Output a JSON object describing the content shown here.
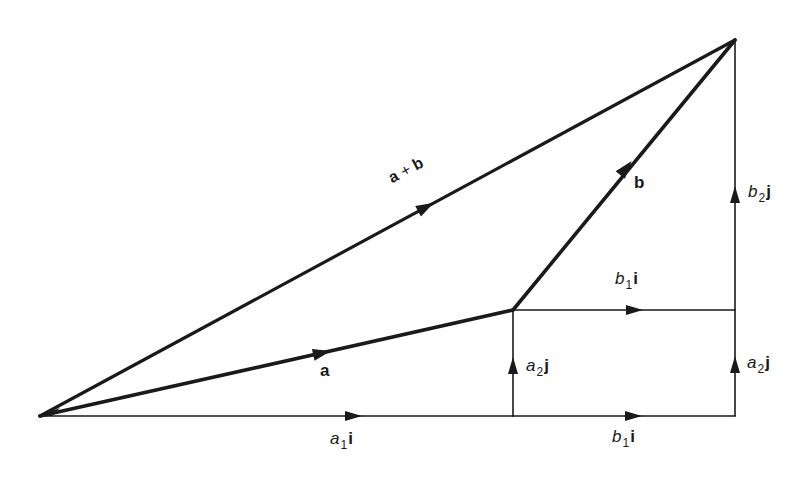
{
  "diagram": {
    "colors": {
      "stroke": "#1a1a1a",
      "background": "#ffffff"
    },
    "points": {
      "O": [
        40,
        416
      ],
      "A": [
        513,
        310
      ],
      "B": [
        735,
        40
      ],
      "C": [
        513,
        416
      ],
      "D": [
        735,
        416
      ],
      "E": [
        735,
        310
      ]
    },
    "labels": {
      "a_plus_b": {
        "a": "a",
        "plus": "+",
        "b": "b"
      },
      "a": "a",
      "b": "b",
      "a1i": {
        "base": "a",
        "sub": "1",
        "unit": "i"
      },
      "b1i_bottom": {
        "base": "b",
        "sub": "1",
        "unit": "i"
      },
      "b1i_middle": {
        "base": "b",
        "sub": "1",
        "unit": "i"
      },
      "a2j_left": {
        "base": "a",
        "sub": "2",
        "unit": "j"
      },
      "a2j_right": {
        "base": "a",
        "sub": "2",
        "unit": "j"
      },
      "b2j": {
        "base": "b",
        "sub": "2",
        "unit": "j"
      }
    },
    "vectors": [
      {
        "name": "a",
        "from": "O",
        "to": "A",
        "weight": "heavy"
      },
      {
        "name": "b",
        "from": "A",
        "to": "B",
        "weight": "heavy"
      },
      {
        "name": "a + b",
        "from": "O",
        "to": "B",
        "weight": "heavy"
      },
      {
        "name": "a1 i",
        "from": "O",
        "to": "C",
        "weight": "light"
      },
      {
        "name": "b1 i",
        "from": "C",
        "to": "D",
        "weight": "light"
      },
      {
        "name": "a2 j",
        "from": "C",
        "to": "A",
        "weight": "light"
      },
      {
        "name": "b1 i",
        "from": "A",
        "to": "E",
        "weight": "light"
      },
      {
        "name": "a2 j",
        "from": "D",
        "to": "E",
        "weight": "light"
      },
      {
        "name": "b2 j",
        "from": "E",
        "to": "B",
        "weight": "light"
      }
    ]
  }
}
